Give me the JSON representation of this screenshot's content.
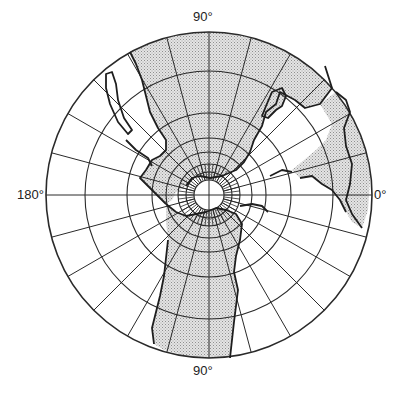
{
  "map": {
    "projection": "azimuthal",
    "center": [
      209,
      195
    ],
    "outer_radius": 163,
    "ring_radii": [
      163,
      124,
      82,
      57,
      43,
      31,
      23,
      15
    ],
    "meridian_count": 24,
    "meridian_inner_radius": 15,
    "colors": {
      "line": "#2a2a2a",
      "land": "#d9d9d9",
      "stipple": "#9a9a9a",
      "coast": "#1e1e1e",
      "background": "#ffffff"
    },
    "labels": {
      "top": "90°",
      "left": "180°",
      "right": "0°",
      "bottom": "90°"
    }
  }
}
